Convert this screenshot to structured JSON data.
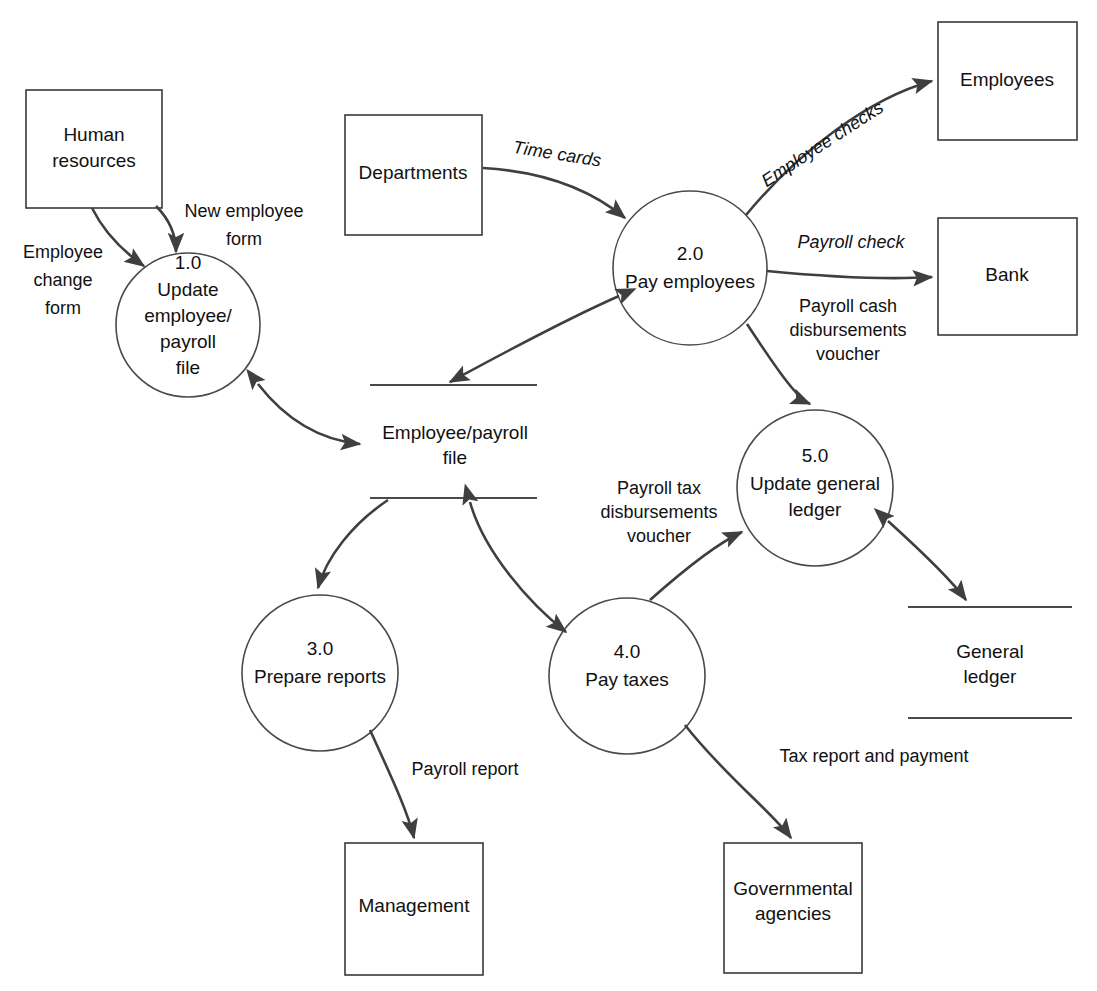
{
  "diagram": {
    "type": "data-flow-diagram",
    "background_color": "#ffffff",
    "line_color": "#3f3f3f",
    "text_color": "#111111"
  },
  "external_entities": [
    {
      "id": "human-resources",
      "label_line1": "Human",
      "label_line2": "resources"
    },
    {
      "id": "departments",
      "label_line1": "Departments",
      "label_line2": ""
    },
    {
      "id": "employees",
      "label_line1": "Employees",
      "label_line2": ""
    },
    {
      "id": "bank",
      "label_line1": "Bank",
      "label_line2": ""
    },
    {
      "id": "management",
      "label_line1": "Management",
      "label_line2": ""
    },
    {
      "id": "governmental-agencies",
      "label_line1": "Governmental",
      "label_line2": "agencies"
    }
  ],
  "processes": [
    {
      "id": "process-1",
      "number": "1.0",
      "name_lines": [
        "Update",
        "employee/",
        "payroll",
        "file"
      ]
    },
    {
      "id": "process-2",
      "number": "2.0",
      "name_lines": [
        "Pay employees"
      ]
    },
    {
      "id": "process-3",
      "number": "3.0",
      "name_lines": [
        "Prepare reports"
      ]
    },
    {
      "id": "process-4",
      "number": "4.0",
      "name_lines": [
        "Pay taxes"
      ]
    },
    {
      "id": "process-5",
      "number": "5.0",
      "name_lines": [
        "Update general",
        "ledger"
      ]
    }
  ],
  "data_stores": [
    {
      "id": "employee-payroll-file",
      "label_line1": "Employee/payroll",
      "label_line2": "file"
    },
    {
      "id": "general-ledger",
      "label_line1": "General",
      "label_line2": "ledger"
    }
  ],
  "data_flows": [
    {
      "id": "flow-employee-change-form",
      "label_line1": "Employee",
      "label_line2": "change",
      "label_line3": "form",
      "from": "human-resources",
      "to": "process-1",
      "style": "upright"
    },
    {
      "id": "flow-new-employee-form",
      "label_line1": "New employee",
      "label_line2": "form",
      "label_line3": "",
      "from": "human-resources",
      "to": "process-1",
      "style": "upright"
    },
    {
      "id": "flow-time-cards",
      "label_line1": "Time cards",
      "label_line2": "",
      "label_line3": "",
      "from": "departments",
      "to": "process-2",
      "style": "italic"
    },
    {
      "id": "flow-employee-checks",
      "label_line1": "Employee checks",
      "label_line2": "",
      "label_line3": "",
      "from": "process-2",
      "to": "employees",
      "style": "italic"
    },
    {
      "id": "flow-payroll-check",
      "label_line1": "Payroll check",
      "label_line2": "",
      "label_line3": "",
      "from": "process-2",
      "to": "bank",
      "style": "italic"
    },
    {
      "id": "flow-payroll-cash-disbursements-voucher",
      "label_line1": "Payroll cash",
      "label_line2": "disbursements",
      "label_line3": "voucher",
      "from": "process-2",
      "to": "process-5",
      "style": "upright"
    },
    {
      "id": "flow-payroll-tax-disbursements-voucher",
      "label_line1": "Payroll tax",
      "label_line2": "disbursements",
      "label_line3": "voucher",
      "from": "process-4",
      "to": "process-5",
      "style": "upright"
    },
    {
      "id": "flow-payroll-report",
      "label_line1": "Payroll report",
      "label_line2": "",
      "label_line3": "",
      "from": "process-3",
      "to": "management",
      "style": "upright"
    },
    {
      "id": "flow-tax-report-and-payment",
      "label_line1": "Tax report and payment",
      "label_line2": "",
      "label_line3": "",
      "from": "process-4",
      "to": "governmental-agencies",
      "style": "upright"
    }
  ]
}
